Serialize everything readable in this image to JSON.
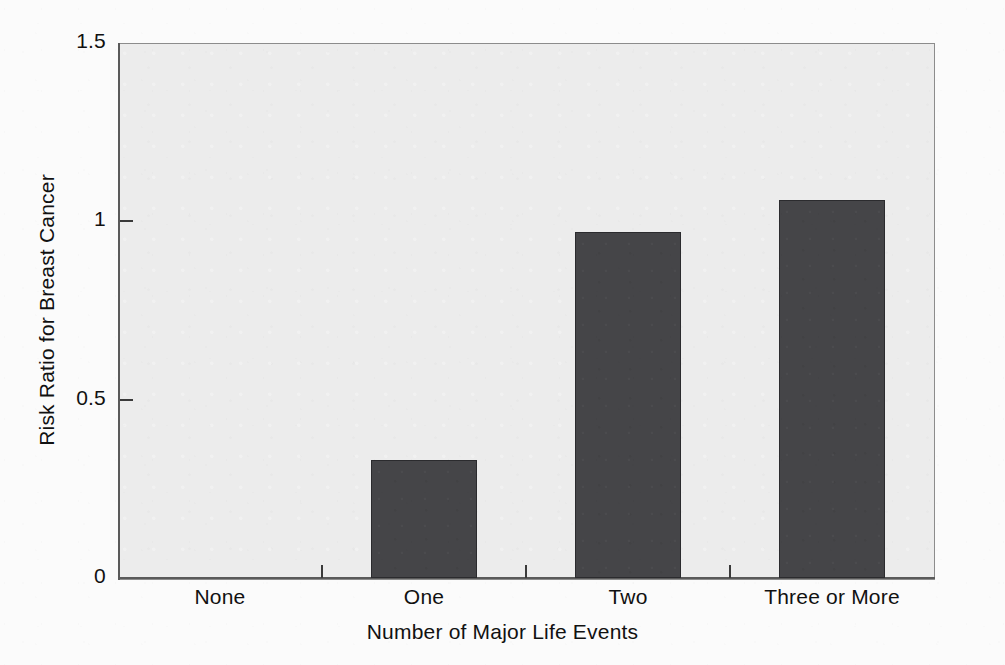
{
  "chart_data": {
    "type": "bar",
    "title": "",
    "xlabel": "Number of Major Life Events",
    "ylabel": "Risk Ratio for Breast Cancer",
    "categories": [
      "None",
      "One",
      "Two",
      "Three or More"
    ],
    "values": [
      0,
      0.33,
      0.97,
      1.06
    ],
    "ylim": [
      0,
      1.5
    ],
    "yticks": [
      0,
      0.5,
      1,
      1.5
    ],
    "ytick_labels": [
      "0",
      "0.5",
      "1",
      "1.5"
    ],
    "grid": false,
    "legend": null,
    "series": [
      {
        "name": "Risk Ratio for Breast Cancer",
        "values": [
          0,
          0.33,
          0.97,
          1.06
        ]
      }
    ],
    "bar_color": "#454548",
    "plot_background": "#ececec",
    "page_background": "#fbfbfb",
    "axis_color": "#5a5a5a"
  },
  "axes": {
    "y_ticks": [
      {
        "label": "1.5",
        "value": 1.5
      },
      {
        "label": "1",
        "value": 1
      },
      {
        "label": "0.5",
        "value": 0.5
      },
      {
        "label": "0",
        "value": 0
      }
    ],
    "x_ticks": [
      {
        "label": "None",
        "value": 0
      },
      {
        "label": "One",
        "value": 0.33
      },
      {
        "label": "Two",
        "value": 0.97
      },
      {
        "label": "Three or More",
        "value": 1.06
      }
    ]
  }
}
